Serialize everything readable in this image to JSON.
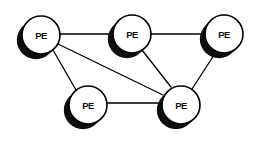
{
  "diagram": {
    "type": "node-link-graph",
    "canvas": {
      "width": 264,
      "height": 144
    },
    "style": {
      "background_color": "#ffffff",
      "node_fill_color": "#ffffff",
      "node_stroke_color": "#000000",
      "node_stroke_width": 1.6,
      "node_radius": 19,
      "shadow_color": "#0d0d0d",
      "shadow_offset_x": -5,
      "shadow_offset_y": 5,
      "edge_color": "#000000",
      "edge_width": 1.3,
      "label_color": "#111111"
    },
    "nodes": [
      {
        "id": "pe1",
        "label": "PE",
        "cx": 41,
        "cy": 35,
        "r": 19
      },
      {
        "id": "pe2",
        "label": "PE",
        "cx": 132,
        "cy": 34,
        "r": 19
      },
      {
        "id": "pe3",
        "label": "PE",
        "cx": 224,
        "cy": 34,
        "r": 19
      },
      {
        "id": "pe4",
        "label": "PE",
        "cx": 88,
        "cy": 105,
        "r": 19
      },
      {
        "id": "pe5",
        "label": "PE",
        "cx": 181,
        "cy": 105,
        "r": 19
      }
    ],
    "edges": [
      {
        "id": "e1",
        "from": "pe1",
        "to": "pe2",
        "x1": 60,
        "y1": 34,
        "x2": 113,
        "y2": 34
      },
      {
        "id": "e2",
        "from": "pe2",
        "to": "pe3",
        "x1": 151,
        "y1": 34,
        "x2": 205,
        "y2": 34
      },
      {
        "id": "e3",
        "from": "pe1",
        "to": "pe4",
        "x1": 53,
        "y1": 50,
        "x2": 76,
        "y2": 90
      },
      {
        "id": "e4",
        "from": "pe1",
        "to": "pe5",
        "x1": 58,
        "y1": 44,
        "x2": 163,
        "y2": 95
      },
      {
        "id": "e5",
        "from": "pe2",
        "to": "pe5",
        "x1": 142,
        "y1": 50,
        "x2": 171,
        "y2": 87
      },
      {
        "id": "e6",
        "from": "pe3",
        "to": "pe5",
        "x1": 216,
        "y1": 52,
        "x2": 192,
        "y2": 89
      },
      {
        "id": "e7",
        "from": "pe4",
        "to": "pe5",
        "x1": 107,
        "y1": 103,
        "x2": 162,
        "y2": 103
      }
    ]
  }
}
